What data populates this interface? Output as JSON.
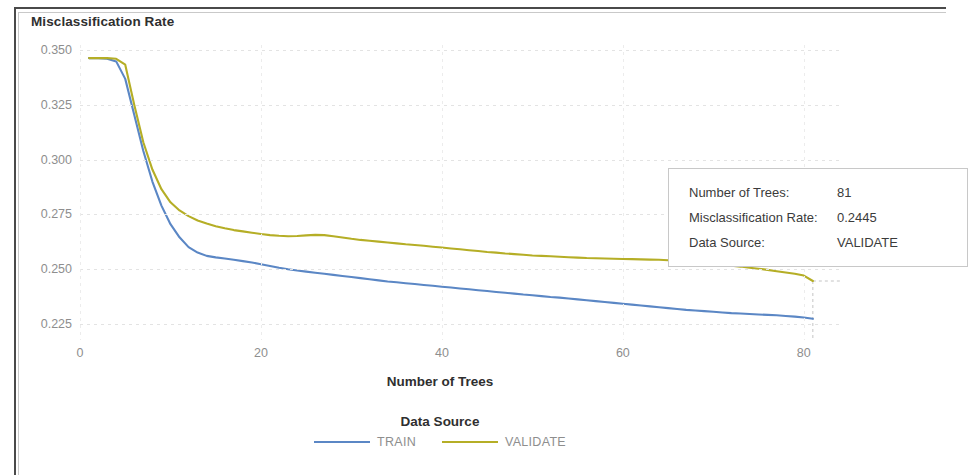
{
  "chart_data": {
    "type": "line",
    "title": "Misclassification Rate",
    "xlabel": "Number of Trees",
    "ylabel": "Misclassification Rate",
    "xlim": [
      0,
      84
    ],
    "ylim": [
      0.2175,
      0.3525
    ],
    "grid": true,
    "xticks": [
      0,
      20,
      40,
      60,
      80
    ],
    "yticks": [
      "0.350",
      "0.325",
      "0.300",
      "0.275",
      "0.250",
      "0.225"
    ],
    "ytick_values": [
      0.35,
      0.325,
      0.3,
      0.275,
      0.25,
      0.225
    ],
    "legend_title": "Data Source",
    "legend_position": "bottom",
    "series": [
      {
        "name": "TRAIN",
        "color": "#5b87c5",
        "x": [
          1,
          2,
          3,
          4,
          5,
          6,
          7,
          8,
          9,
          10,
          11,
          12,
          13,
          14,
          15,
          16,
          17,
          18,
          19,
          20,
          21,
          22,
          23,
          24,
          25,
          26,
          27,
          28,
          29,
          30,
          31,
          32,
          33,
          34,
          35,
          36,
          37,
          38,
          39,
          40,
          41,
          42,
          43,
          44,
          45,
          46,
          47,
          48,
          49,
          50,
          51,
          52,
          53,
          54,
          55,
          56,
          57,
          58,
          59,
          60,
          61,
          62,
          63,
          64,
          65,
          66,
          67,
          68,
          69,
          70,
          71,
          72,
          73,
          74,
          75,
          76,
          77,
          78,
          79,
          80,
          81
        ],
        "values": [
          0.3465,
          0.3465,
          0.3462,
          0.345,
          0.337,
          0.3205,
          0.304,
          0.29,
          0.279,
          0.2705,
          0.2645,
          0.26,
          0.2575,
          0.256,
          0.2553,
          0.2548,
          0.2542,
          0.2536,
          0.253,
          0.2522,
          0.2514,
          0.2506,
          0.2499,
          0.2493,
          0.2488,
          0.2483,
          0.2478,
          0.2473,
          0.2468,
          0.2463,
          0.2458,
          0.2453,
          0.2448,
          0.2443,
          0.2439,
          0.2435,
          0.2431,
          0.2427,
          0.2423,
          0.2419,
          0.2415,
          0.2411,
          0.2407,
          0.2403,
          0.2399,
          0.2395,
          0.2391,
          0.2387,
          0.2383,
          0.238,
          0.2376,
          0.2372,
          0.2369,
          0.2365,
          0.2361,
          0.2357,
          0.2353,
          0.2349,
          0.2345,
          0.2341,
          0.2337,
          0.2333,
          0.2329,
          0.2325,
          0.2321,
          0.2317,
          0.2313,
          0.231,
          0.2307,
          0.2304,
          0.2301,
          0.2298,
          0.2296,
          0.2294,
          0.2292,
          0.229,
          0.2288,
          0.2285,
          0.2282,
          0.2278,
          0.2272
        ]
      },
      {
        "name": "VALIDATE",
        "color": "#b5ae26",
        "x": [
          1,
          2,
          3,
          4,
          5,
          6,
          7,
          8,
          9,
          10,
          11,
          12,
          13,
          14,
          15,
          16,
          17,
          18,
          19,
          20,
          21,
          22,
          23,
          24,
          25,
          26,
          27,
          28,
          29,
          30,
          31,
          32,
          33,
          34,
          35,
          36,
          37,
          38,
          39,
          40,
          41,
          42,
          43,
          44,
          45,
          46,
          47,
          48,
          49,
          50,
          51,
          52,
          53,
          54,
          55,
          56,
          57,
          58,
          59,
          60,
          61,
          62,
          63,
          64,
          65,
          66,
          67,
          68,
          69,
          70,
          71,
          72,
          73,
          74,
          75,
          76,
          77,
          78,
          79,
          80,
          81
        ],
        "values": [
          0.3465,
          0.3465,
          0.3465,
          0.3462,
          0.3435,
          0.325,
          0.308,
          0.2955,
          0.2865,
          0.2805,
          0.2768,
          0.2742,
          0.2722,
          0.2708,
          0.2696,
          0.2686,
          0.2678,
          0.2672,
          0.2666,
          0.266,
          0.2655,
          0.2652,
          0.265,
          0.2651,
          0.2654,
          0.2656,
          0.2655,
          0.265,
          0.2644,
          0.2638,
          0.2633,
          0.2629,
          0.2625,
          0.2621,
          0.2617,
          0.2613,
          0.261,
          0.2606,
          0.2602,
          0.2598,
          0.2594,
          0.259,
          0.2586,
          0.2582,
          0.2578,
          0.2575,
          0.2571,
          0.2568,
          0.2565,
          0.2562,
          0.256,
          0.2558,
          0.2556,
          0.2554,
          0.2552,
          0.255,
          0.2549,
          0.2548,
          0.2547,
          0.2546,
          0.2545,
          0.2544,
          0.2543,
          0.2542,
          0.254,
          0.2538,
          0.2535,
          0.2531,
          0.2527,
          0.2523,
          0.2519,
          0.2515,
          0.2511,
          0.2506,
          0.2501,
          0.2496,
          0.249,
          0.2484,
          0.2478,
          0.247,
          0.2445
        ]
      }
    ],
    "highlight": {
      "x": 81,
      "y": 0.2445,
      "series": "VALIDATE"
    }
  },
  "tooltip": {
    "rows": [
      {
        "label": "Number of Trees:",
        "value": "81"
      },
      {
        "label": "Misclassification Rate:",
        "value": "0.2445"
      },
      {
        "label": "Data Source:",
        "value": "VALIDATE"
      }
    ]
  }
}
